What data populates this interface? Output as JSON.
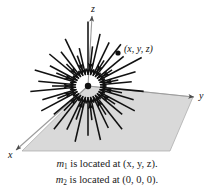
{
  "figure": {
    "axes": {
      "z_label": "z",
      "y_label": "y",
      "x_label": "x"
    },
    "point_label": "(x, y, z)",
    "caption": {
      "line1": {
        "symbol": "m",
        "subscript": "1",
        "text": " is located at (x, y, z)."
      },
      "line2": {
        "symbol": "m",
        "subscript": "2",
        "text": " is located at (0, 0, 0)."
      }
    },
    "colors": {
      "plane_fill": "#d8d8d8",
      "plane_stroke": "#9a9a9a",
      "arrow": "#111111",
      "axis": "#9a9a9a",
      "text": "#111111",
      "background": "#ffffff"
    },
    "geometry": {
      "origin": [
        88,
        86
      ],
      "mass_point": [
        118,
        53
      ],
      "plane_corners": [
        [
          88,
          86
        ],
        [
          193,
          97
        ],
        [
          170,
          151
        ],
        [
          22,
          151
        ]
      ],
      "z_axis_top": [
        92,
        14
      ],
      "y_axis_end": [
        196,
        97
      ],
      "x_axis_end": [
        14,
        152
      ]
    }
  },
  "chart_data": {
    "type": "scatter",
    "xlabel": "y",
    "ylabel": "z",
    "arrow_count": 40,
    "arrows": [
      {
        "angle": -90,
        "radius_inner": 12,
        "radius_outer": 70
      },
      {
        "angle": -78,
        "radius_inner": 12,
        "radius_outer": 58
      },
      {
        "angle": -66,
        "radius_inner": 12,
        "radius_outer": 52
      },
      {
        "angle": -54,
        "radius_inner": 12,
        "radius_outer": 56
      },
      {
        "angle": -42,
        "radius_inner": 12,
        "radius_outer": 48
      },
      {
        "angle": -30,
        "radius_inner": 12,
        "radius_outer": 62
      },
      {
        "angle": -18,
        "radius_inner": 12,
        "radius_outer": 50
      },
      {
        "angle": -6,
        "radius_inner": 12,
        "radius_outer": 44
      },
      {
        "angle": 6,
        "radius_inner": 12,
        "radius_outer": 56
      },
      {
        "angle": 18,
        "radius_inner": 12,
        "radius_outer": 48
      },
      {
        "angle": 30,
        "radius_inner": 12,
        "radius_outer": 54
      },
      {
        "angle": 42,
        "radius_inner": 12,
        "radius_outer": 46
      },
      {
        "angle": 54,
        "radius_inner": 12,
        "radius_outer": 58
      },
      {
        "angle": 66,
        "radius_inner": 12,
        "radius_outer": 50
      },
      {
        "angle": 78,
        "radius_inner": 12,
        "radius_outer": 60
      },
      {
        "angle": 90,
        "radius_inner": 12,
        "radius_outer": 54
      },
      {
        "angle": 102,
        "radius_inner": 12,
        "radius_outer": 62
      },
      {
        "angle": 114,
        "radius_inner": 12,
        "radius_outer": 52
      },
      {
        "angle": 126,
        "radius_inner": 12,
        "radius_outer": 58
      },
      {
        "angle": 138,
        "radius_inner": 12,
        "radius_outer": 46
      },
      {
        "angle": 150,
        "radius_inner": 12,
        "radius_outer": 54
      },
      {
        "angle": 162,
        "radius_inner": 12,
        "radius_outer": 48
      },
      {
        "angle": 174,
        "radius_inner": 12,
        "radius_outer": 58
      },
      {
        "angle": 186,
        "radius_inner": 12,
        "radius_outer": 50
      },
      {
        "angle": 198,
        "radius_inner": 12,
        "radius_outer": 56
      },
      {
        "angle": 210,
        "radius_inner": 12,
        "radius_outer": 44
      },
      {
        "angle": 222,
        "radius_inner": 12,
        "radius_outer": 52
      },
      {
        "angle": 234,
        "radius_inner": 12,
        "radius_outer": 46
      },
      {
        "angle": 246,
        "radius_inner": 12,
        "radius_outer": 56
      },
      {
        "angle": 258,
        "radius_inner": 12,
        "radius_outer": 42
      }
    ]
  }
}
